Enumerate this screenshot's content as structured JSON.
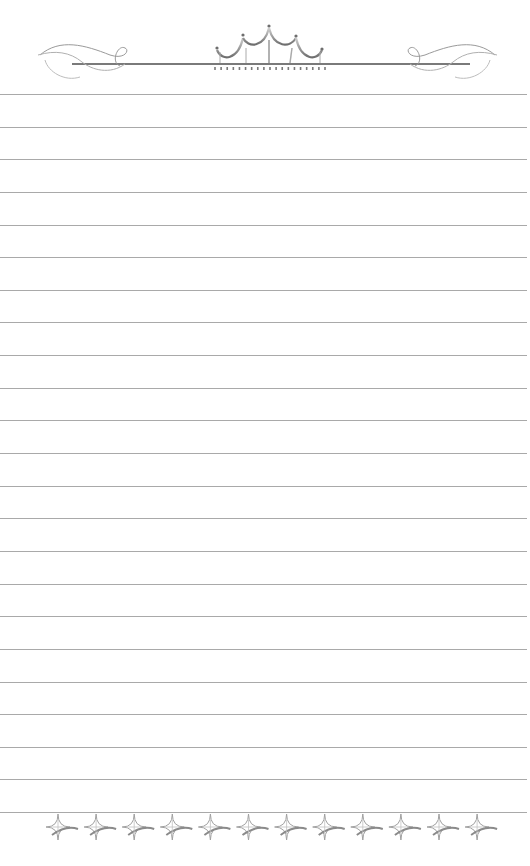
{
  "page": {
    "type": "lined-stationery",
    "background_color": "#ffffff",
    "line_color": "#a9a9a9",
    "ornament_color": "#8a8a8a"
  },
  "header": {
    "ornament": "crown-with-scrolls",
    "rule_y": 64,
    "rule_x_start": 72,
    "rule_x_end": 470,
    "crown_points": [
      {
        "x": 217,
        "y": 48
      },
      {
        "x": 243,
        "y": 35
      },
      {
        "x": 269,
        "y": 26
      },
      {
        "x": 296,
        "y": 36
      },
      {
        "x": 322,
        "y": 49
      }
    ],
    "fringe_count": 19,
    "left_scroll": "flourish-left",
    "right_scroll": "flourish-right"
  },
  "lines": {
    "count": 23,
    "first_y": 94,
    "spacing": 32.64,
    "width": 527
  },
  "footer": {
    "ornament": "four-point-star-chain",
    "star_count": 12,
    "first_center_x": 58,
    "spacing": 38.1,
    "center_y": 827
  }
}
